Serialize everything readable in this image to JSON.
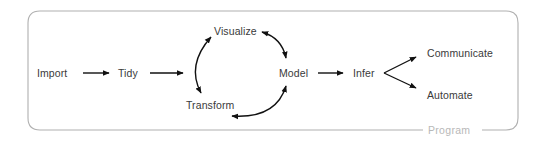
{
  "diagram": {
    "container": {
      "label": "Program",
      "border_color": "#b0b0b0",
      "label_color": "#b8b8b8"
    },
    "text_color": "#3a3a3a",
    "arrow_color": "#111111",
    "nodes": {
      "import": "Import",
      "tidy": "Tidy",
      "visualize": "Visualize",
      "transform": "Transform",
      "model": "Model",
      "infer": "Infer",
      "communicate": "Communicate",
      "automate": "Automate"
    },
    "edges": [
      {
        "from": "Import",
        "to": "Tidy",
        "type": "arrow"
      },
      {
        "from": "Tidy",
        "to": "Understand cycle",
        "type": "arrow"
      },
      {
        "from": "Visualize",
        "to": "Transform",
        "type": "bidirectional-arc"
      },
      {
        "from": "Visualize",
        "to": "Model",
        "type": "bidirectional-arc"
      },
      {
        "from": "Transform",
        "to": "Model",
        "type": "bidirectional-arc"
      },
      {
        "from": "Model",
        "to": "Infer",
        "type": "arrow"
      },
      {
        "from": "Infer",
        "to": "Communicate",
        "type": "arrow"
      },
      {
        "from": "Infer",
        "to": "Automate",
        "type": "arrow"
      }
    ]
  }
}
